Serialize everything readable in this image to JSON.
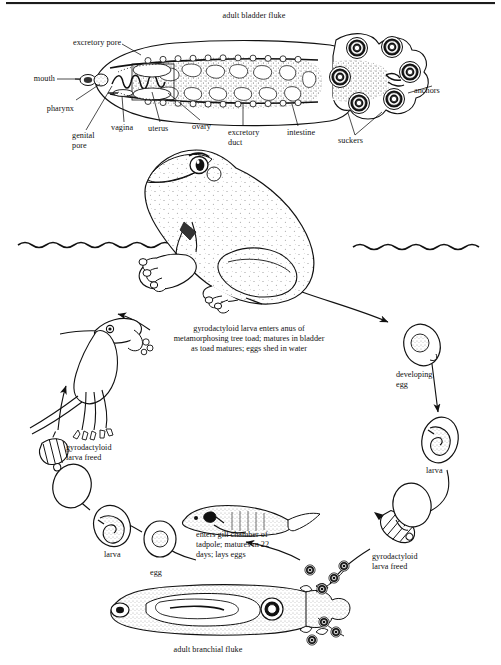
{
  "figure": {
    "title_top": "adult bladder fluke",
    "title_bottom": "adult branchial fluke",
    "background_color": "#ffffff",
    "ink_color": "#111111"
  },
  "anatomy_labels": {
    "mouth": "mouth",
    "excretory_pore": "excretory pore",
    "pharynx": "pharynx",
    "genital_pore": "genital\npore",
    "vagina": "vagina",
    "uterus": "uterus",
    "ovary": "ovary",
    "excretory_duct": "excretory\nduct",
    "intestine": "intestine",
    "anchors": "anchors",
    "suckers": "suckers"
  },
  "cycle_labels": {
    "bladder_infection": "gyrodactyloid larva enters anus of\nmetamorphosing tree toad; matures in bladder\nas toad matures; eggs shed in water",
    "developing_egg": "developing\negg",
    "larva_right": "larva",
    "gyro_larva_freed_right": "gyrodactyloid\nlarva freed",
    "gill_infection": "enters gill chamber of\ntadpole; matures in 22\ndays; lays eggs",
    "egg_bottom": "egg",
    "larva_left": "larva",
    "gyro_larva_freed_left": "gyrodactyloid\nlarva freed"
  },
  "scene": {
    "water_line_label": "water surface",
    "host_toad": "tree toad",
    "host_tadpole": "tadpole",
    "host_metamorph": "metamorphosing toadlet"
  }
}
